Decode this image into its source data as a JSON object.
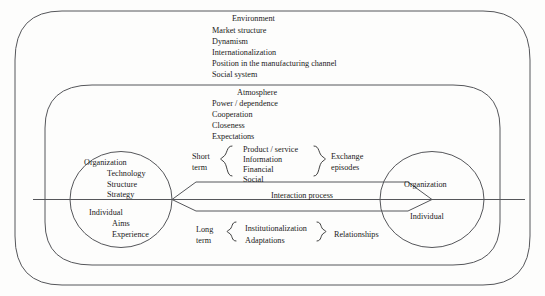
{
  "diagram": {
    "stroke_color": "#55565a",
    "text_color": "#1a1a1a",
    "background": "#fdfdfc",
    "outer_frame": {
      "name": "environment-frame"
    },
    "inner_frame": {
      "name": "atmosphere-frame"
    },
    "environment": {
      "heading": "Environment",
      "items": [
        "Market structure",
        "Dynamism",
        "Internationalization",
        "Position in the manufacturing channel",
        "Social system"
      ]
    },
    "atmosphere": {
      "heading": "Atmosphere",
      "items": [
        "Power / dependence",
        "Cooperation",
        "Closeness",
        "Expectations"
      ]
    },
    "left_party": {
      "top_heading": "Organization",
      "top_items": [
        "Technology",
        "Structure",
        "Strategy"
      ],
      "bottom_heading": "Individual",
      "bottom_items": [
        "Aims",
        "Experience"
      ]
    },
    "right_party": {
      "top_heading": "Organization",
      "bottom_heading": "Individual"
    },
    "short_term": {
      "left_label_line1": "Short",
      "left_label_line2": "term",
      "items": [
        "Product / service",
        "Information",
        "Financial",
        "Social"
      ],
      "right_label_line1": "Exchange",
      "right_label_line2": "episodes"
    },
    "interaction_band": {
      "label": "Interaction process"
    },
    "long_term": {
      "left_label_line1": "Long",
      "left_label_line2": "term",
      "items": [
        "Institutionalization",
        "Adaptations"
      ],
      "right_label": "Relationships"
    }
  }
}
